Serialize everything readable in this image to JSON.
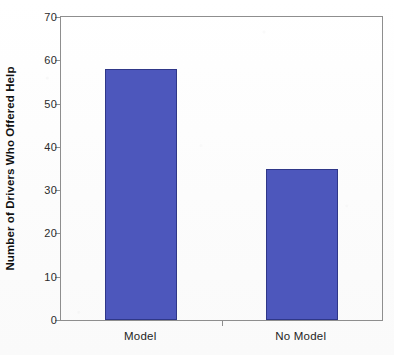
{
  "chart_data": {
    "type": "bar",
    "title": "",
    "xlabel": "",
    "ylabel": "Number of Drivers Who Offered Help",
    "categories": [
      "Model",
      "No Model"
    ],
    "values": [
      58,
      35
    ],
    "series": [
      {
        "name": "Number of Drivers Who Offered Help",
        "values": [
          58,
          35
        ]
      }
    ],
    "ylim": [
      0,
      70
    ],
    "yticks": [
      0,
      10,
      20,
      30,
      40,
      50,
      60,
      70
    ],
    "ytick_labels": [
      "0",
      "10",
      "20",
      "30",
      "40",
      "50",
      "60",
      "70"
    ],
    "grid": false,
    "legend": false,
    "legend_position": "none",
    "bar_color": "#4d57bc",
    "bar_edge_color": "#2f3788",
    "axis_color": "#8e8e8e",
    "background_color": "#fdfdfd"
  },
  "axis": {
    "y_title": "Number of Drivers Who Offered Help"
  }
}
